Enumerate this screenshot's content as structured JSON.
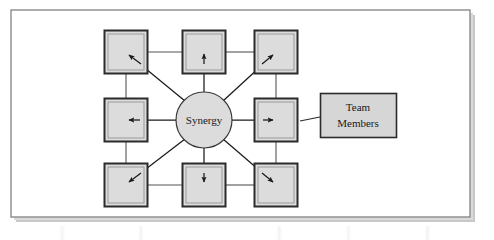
{
  "figure": {
    "name": "synergy-team-diagram",
    "canvas": {
      "width": 494,
      "height": 240,
      "background_color": "#ffffff",
      "frame": {
        "x": 11,
        "y": 10,
        "width": 459,
        "height": 207,
        "border_color": "#8a8a8a",
        "fill_color": "#ffffff",
        "shadow_color": "#c8c8c8"
      }
    },
    "center_node": {
      "label": "Synergy",
      "shape": "circle",
      "cx": 204,
      "cy": 120,
      "r": 28,
      "fill_color": "#dcdcdc",
      "stroke_color": "#3a3a3a",
      "font_size": 11
    },
    "callout": {
      "label_line_1": "Team",
      "label_line_2": "Members",
      "shape": "rectangle",
      "x": 320,
      "y": 93,
      "width": 76,
      "height": 44,
      "fill_color": "#d6d6d6",
      "stroke_color": "#2b2b2b",
      "font_size": 11,
      "leader_line": {
        "from_x": 320,
        "from_y": 117,
        "to_x": 300,
        "to_y": 121,
        "stroke_color": "#2b2b2b"
      }
    },
    "member_nodes": [
      {
        "id": "top-left",
        "cx": 126,
        "cy": 52,
        "row": 0,
        "col": 0
      },
      {
        "id": "top-center",
        "cx": 204,
        "cy": 52,
        "row": 0,
        "col": 1
      },
      {
        "id": "top-right",
        "cx": 276,
        "cy": 52,
        "row": 0,
        "col": 2
      },
      {
        "id": "middle-left",
        "cx": 126,
        "cy": 120,
        "row": 1,
        "col": 0
      },
      {
        "id": "middle-right",
        "cx": 276,
        "cy": 120,
        "row": 1,
        "col": 2
      },
      {
        "id": "bottom-left",
        "cx": 126,
        "cy": 185,
        "row": 2,
        "col": 0
      },
      {
        "id": "bottom-center",
        "cx": 204,
        "cy": 185,
        "row": 2,
        "col": 1
      },
      {
        "id": "bottom-right",
        "cx": 276,
        "cy": 185,
        "row": 2,
        "col": 2
      }
    ],
    "node_style": {
      "size": 43,
      "fill_color": "#dcdcdc",
      "outer_stroke_color": "#2b2b2b",
      "inner_stroke_color": "#9a9a9a",
      "bevel_light_color": "#f2f2f2",
      "bevel_dark_color": "#4a4a4a"
    },
    "connector_style": {
      "stroke_color": "#555555",
      "arrow_color": "#1a1a1a"
    },
    "arrows": [
      {
        "from": "center",
        "to": "top-left",
        "direction": "up-left"
      },
      {
        "from": "center",
        "to": "top-center",
        "direction": "up"
      },
      {
        "from": "center",
        "to": "top-right",
        "direction": "up-right"
      },
      {
        "from": "center",
        "to": "middle-left",
        "direction": "left"
      },
      {
        "from": "center",
        "to": "middle-right",
        "direction": "right"
      },
      {
        "from": "center",
        "to": "bottom-left",
        "direction": "down-left"
      },
      {
        "from": "center",
        "to": "bottom-center",
        "direction": "down"
      },
      {
        "from": "center",
        "to": "bottom-right",
        "direction": "down-right"
      }
    ],
    "perimeter_links": [
      {
        "from": "top-left",
        "to": "top-center"
      },
      {
        "from": "top-center",
        "to": "top-right"
      },
      {
        "from": "top-left",
        "to": "middle-left"
      },
      {
        "from": "top-right",
        "to": "middle-right"
      },
      {
        "from": "middle-left",
        "to": "bottom-left"
      },
      {
        "from": "middle-right",
        "to": "bottom-right"
      },
      {
        "from": "bottom-left",
        "to": "bottom-center"
      },
      {
        "from": "bottom-center",
        "to": "bottom-right"
      }
    ]
  }
}
